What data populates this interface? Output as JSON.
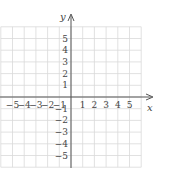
{
  "chart_data": {
    "type": "scatter",
    "title": "",
    "xlabel": "x",
    "ylabel": "y",
    "xlim": [
      -6,
      6
    ],
    "ylim": [
      -6,
      6
    ],
    "grid": true,
    "x_ticks": [
      "−5",
      "−4",
      "−3",
      "−2",
      "−1",
      "1",
      "2",
      "3",
      "4",
      "5"
    ],
    "y_ticks": [
      "5",
      "4",
      "3",
      "2",
      "1",
      "−1",
      "−2",
      "−3",
      "−4",
      "−5"
    ],
    "series": []
  },
  "colors": {
    "grid": "#d9d9d9",
    "axis": "#555555",
    "text": "#444444"
  }
}
